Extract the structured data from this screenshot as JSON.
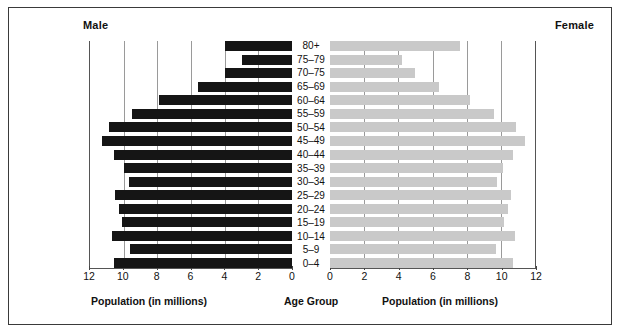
{
  "figure": {
    "male_header": "Male",
    "female_header": "Female",
    "male_axis_caption": "Population (in millions)",
    "center_caption": "Age Group",
    "female_axis_caption": "Population (in millions)",
    "male_bar_color": "#151515",
    "female_bar_color": "#c9c9c9",
    "frame_color": "#3a3a3a",
    "gridline_color": "#9a9a9a"
  },
  "chart_data": {
    "type": "bar",
    "title": "",
    "subtitle": "",
    "orientation": "horizontal",
    "layout": "population-pyramid",
    "xlabel": "Population (in millions)",
    "ylabel": "Age Group",
    "grid": true,
    "legend": "none",
    "categories": [
      "0–4",
      "5–9",
      "10–14",
      "15–19",
      "20–24",
      "25–29",
      "30–34",
      "35–39",
      "40–44",
      "45–49",
      "50–54",
      "55–59",
      "60–64",
      "65–69",
      "70–75",
      "75–79",
      "80+"
    ],
    "categories_top_to_bottom": [
      "80+",
      "75–79",
      "70–75",
      "65–69",
      "60–64",
      "55–59",
      "50–54",
      "45–49",
      "40–44",
      "35–39",
      "30–34",
      "25–29",
      "20–24",
      "15–19",
      "10–14",
      "5–9",
      "0–4"
    ],
    "male_xlim": [
      12,
      0
    ],
    "female_xlim": [
      0,
      12
    ],
    "male_ticks": [
      12,
      10,
      8,
      6,
      4,
      2,
      0
    ],
    "female_ticks": [
      0,
      2,
      4,
      6,
      8,
      10,
      12
    ],
    "series": [
      {
        "name": "Male",
        "color": "#151515",
        "direction": "left",
        "values_top_to_bottom": [
          4.0,
          3.0,
          4.0,
          5.6,
          7.9,
          9.5,
          10.9,
          11.3,
          10.6,
          10.0,
          9.7,
          10.5,
          10.3,
          10.1,
          10.7,
          9.6,
          10.6
        ]
      },
      {
        "name": "Female",
        "color": "#c9c9c9",
        "direction": "right",
        "values_top_to_bottom": [
          7.6,
          4.2,
          5.0,
          6.4,
          8.2,
          9.6,
          10.9,
          11.4,
          10.7,
          10.1,
          9.8,
          10.6,
          10.4,
          10.2,
          10.8,
          9.7,
          10.7
        ]
      }
    ]
  }
}
